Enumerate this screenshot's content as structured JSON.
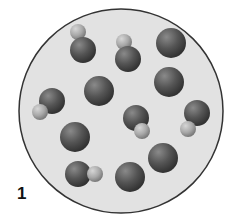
{
  "diagram": {
    "label": "1",
    "container": {
      "cx": 121,
      "cy": 111,
      "r": 102,
      "fill": "#e2e2e2",
      "stroke": "#333333"
    },
    "colors": {
      "large_atom": "#555555",
      "small_atom": "#a8a8a8"
    },
    "atoms": [
      {
        "type": "single",
        "large": {
          "cx": 171,
          "cy": 43,
          "r": 15
        }
      },
      {
        "type": "single",
        "large": {
          "cx": 99,
          "cy": 91,
          "r": 15
        }
      },
      {
        "type": "single",
        "large": {
          "cx": 169,
          "cy": 82,
          "r": 15
        }
      },
      {
        "type": "single",
        "large": {
          "cx": 75,
          "cy": 137,
          "r": 15
        }
      },
      {
        "type": "single",
        "large": {
          "cx": 163,
          "cy": 158,
          "r": 15
        }
      },
      {
        "type": "single",
        "large": {
          "cx": 130,
          "cy": 177,
          "r": 15
        }
      },
      {
        "type": "molecule",
        "large": {
          "cx": 83,
          "cy": 50,
          "r": 13
        },
        "small": {
          "cx": 78,
          "cy": 32,
          "r": 8
        }
      },
      {
        "type": "molecule",
        "large": {
          "cx": 128,
          "cy": 59,
          "r": 13
        },
        "small": {
          "cx": 124,
          "cy": 42,
          "r": 8
        }
      },
      {
        "type": "molecule",
        "large": {
          "cx": 52,
          "cy": 101,
          "r": 13
        },
        "small": {
          "cx": 40,
          "cy": 112,
          "r": 8
        }
      },
      {
        "type": "molecule",
        "large": {
          "cx": 136,
          "cy": 118,
          "r": 13
        },
        "small": {
          "cx": 142,
          "cy": 131,
          "r": 8
        }
      },
      {
        "type": "molecule",
        "large": {
          "cx": 197,
          "cy": 113,
          "r": 13
        },
        "small": {
          "cx": 188,
          "cy": 129,
          "r": 8
        }
      },
      {
        "type": "molecule",
        "large": {
          "cx": 78,
          "cy": 174,
          "r": 13
        },
        "small": {
          "cx": 95,
          "cy": 174,
          "r": 8
        }
      }
    ]
  }
}
